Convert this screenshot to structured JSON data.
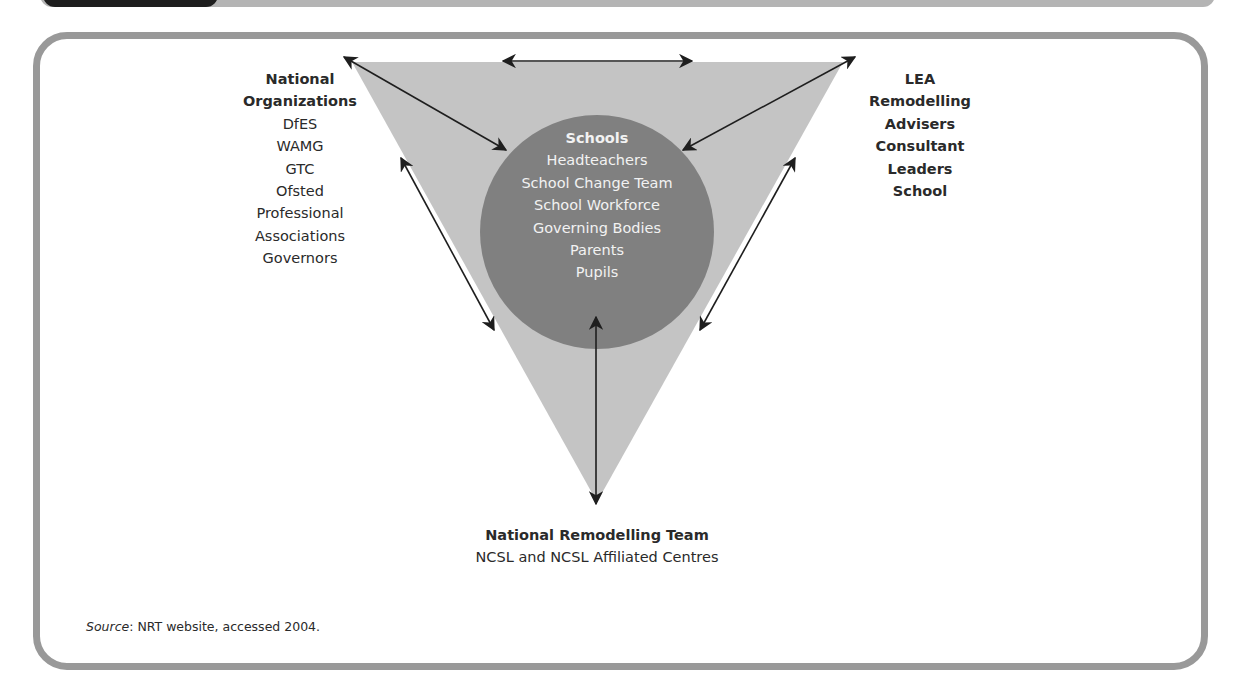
{
  "figure": {
    "header_tab_color": "#1e1e1e",
    "header_bar_color": "#b4b4b4",
    "frame_color": "#999999",
    "triangle_color": "#c4c4c4",
    "circle_color": "#808080",
    "arrow_color": "#1e1e1e"
  },
  "nodes": {
    "left": {
      "title_lines": [
        "National",
        "Organizations"
      ],
      "items": [
        "DfES",
        "WAMG",
        "GTC",
        "Ofsted",
        "Professional",
        "Associations",
        "Governors"
      ]
    },
    "right": {
      "lines": [
        "LEA",
        "Remodelling",
        "Advisers",
        "Consultant",
        "Leaders",
        "School"
      ]
    },
    "center": {
      "title": "Schools",
      "items": [
        "Headteachers",
        "School Change Team",
        "School Workforce",
        "Governing Bodies",
        "Parents",
        "Pupils"
      ]
    },
    "bottom": {
      "title": "National Remodelling Team",
      "subtitle": "NCSL and NCSL Affiliated Centres"
    }
  },
  "arrows": [
    {
      "from": "top-left-vertex",
      "to": "top-right-vertex",
      "type": "bidirectional"
    },
    {
      "from": "national-organizations",
      "to": "schools",
      "type": "bidirectional"
    },
    {
      "from": "lea",
      "to": "schools",
      "type": "bidirectional"
    },
    {
      "from": "national-organizations",
      "to": "national-remodelling-team",
      "type": "bidirectional"
    },
    {
      "from": "lea",
      "to": "national-remodelling-team",
      "type": "bidirectional"
    },
    {
      "from": "schools",
      "to": "national-remodelling-team",
      "type": "bidirectional"
    }
  ],
  "source": {
    "label": "Source",
    "text": ": NRT website, accessed 2004."
  }
}
